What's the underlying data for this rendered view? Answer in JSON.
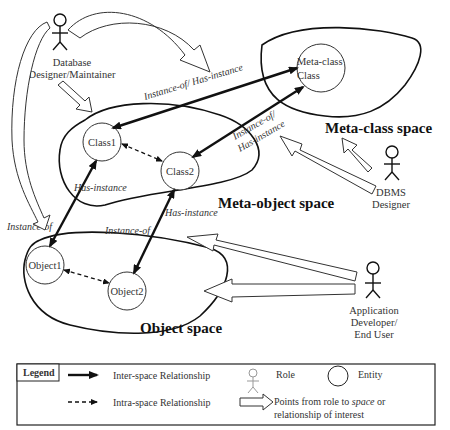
{
  "spaces": {
    "meta_class": "Meta-class space",
    "meta_object": "Meta-object space",
    "object": "Object space"
  },
  "entities": {
    "meta_class_class": [
      "Meta-class",
      "Class"
    ],
    "class1": "Class1",
    "class2": "Class2",
    "object1": "Object1",
    "object2": "Object2"
  },
  "roles": {
    "db_designer": [
      "Database",
      "Designer/Maintainer"
    ],
    "dbms_designer": [
      "DBMS",
      "Designer"
    ],
    "app_developer": [
      "Application",
      "Developer/",
      "End User"
    ]
  },
  "relationships": {
    "class1_metaclass": "Instance-of/ Has-instance",
    "class2_metaclass": [
      "Instance-of/",
      "Has-instance"
    ],
    "class1_has_instance": "Has-instance",
    "object1_instance_of": "Instance-of",
    "class2_has_instance": "Has-instance",
    "object2_instance_of": "Instance-of"
  },
  "legend": {
    "title": "Legend",
    "inter_space": "Inter-space Relationship",
    "intra_space": "Intra-space Relationship",
    "role": "Role",
    "entity": "Entity",
    "points_from": "Points from role to ",
    "points_space": "space",
    "points_or": " or",
    "points_line2": "relationship of interest"
  }
}
